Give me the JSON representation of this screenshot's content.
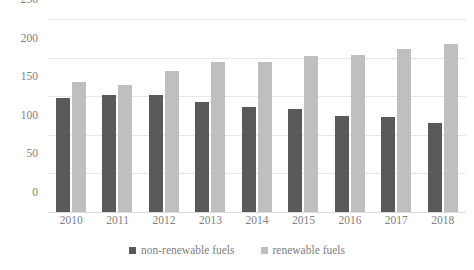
{
  "chart_data": {
    "type": "bar",
    "title": "",
    "subtitle": "",
    "xlabel": "",
    "ylabel": "",
    "categories": [
      "2010",
      "2011",
      "2012",
      "2013",
      "2014",
      "2015",
      "2016",
      "2017",
      "2018"
    ],
    "series": [
      {
        "name": "non-renewable fuels",
        "color": "#595959",
        "values": [
          148,
          151,
          152,
          142,
          136,
          133,
          125,
          123,
          115
        ]
      },
      {
        "name": "renewable fuels",
        "color": "#bfbfbf",
        "values": [
          168,
          165,
          183,
          194,
          194,
          202,
          204,
          211,
          217
        ]
      }
    ],
    "ylim": [
      0,
      250
    ],
    "yticks": [
      0,
      50,
      100,
      150,
      200,
      250
    ],
    "ytick_labels": [
      "0",
      "50",
      "100",
      "150",
      "200",
      "250"
    ],
    "grid": true,
    "legend_position": "bottom",
    "orientation": "vertical",
    "grouping": "grouped"
  },
  "legend": {
    "items": [
      {
        "label": "non-renewable fuels"
      },
      {
        "label": "renewable fuels"
      }
    ]
  },
  "colors": {
    "series_non_renewable": "#595959",
    "series_renewable": "#bfbfbf",
    "gridline": "#e8e8e8",
    "tick_text": "#808080",
    "background": "#ffffff"
  }
}
